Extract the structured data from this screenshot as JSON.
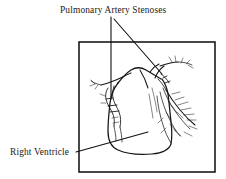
{
  "figure": {
    "background_color": "#ffffff",
    "ink_color": "#161616",
    "frame": {
      "name": "diagram-border",
      "x": 79,
      "y": 42,
      "width": 136,
      "height": 130,
      "stroke_color": "#1b1b1b"
    },
    "labels": [
      {
        "id": "pulmonary-artery-stenoses",
        "text": "Pulmonary Artery Stenoses",
        "x": 60,
        "y": 13,
        "anchor": "start"
      },
      {
        "id": "right-ventricle",
        "text": "Right Ventricle",
        "x": 10,
        "y": 155,
        "anchor": "start"
      }
    ],
    "leaders": [
      {
        "id": "leader-stenosis-left",
        "from_label": "pulmonary-artery-stenoses",
        "points": "111,17 111,99"
      },
      {
        "id": "leader-stenosis-right",
        "from_label": "pulmonary-artery-stenoses",
        "points": "114,19 162,74"
      },
      {
        "id": "leader-right-ventricle",
        "from_label": "right-ventricle",
        "points": "76,152 148,132"
      }
    ],
    "anatomy": {
      "ventricle_label": "right ventricle chamber outline",
      "trunk_label": "pulmonary trunk",
      "left_branch_label": "left pulmonary artery branches",
      "right_branch_label": "right pulmonary artery branches",
      "stenosis_count": 2
    }
  }
}
